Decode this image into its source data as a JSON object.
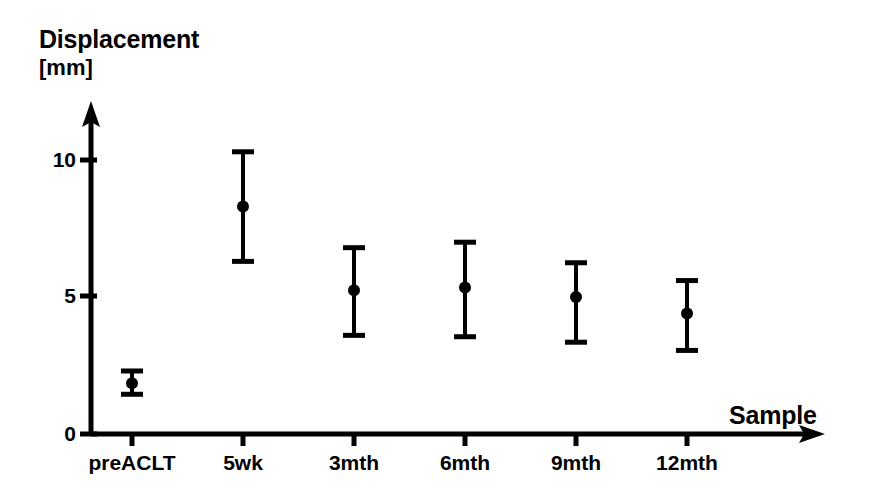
{
  "chart_data": {
    "type": "scatter",
    "title": "",
    "ylabel": "Displacement",
    "yunit": "[mm]",
    "xlabel": "Sample",
    "categories": [
      "preACLT",
      "5wk",
      "3mth",
      "6mth",
      "9mth",
      "12mth"
    ],
    "ytick_labels": [
      "0",
      "5",
      "10"
    ],
    "ytick_values": [
      0,
      5,
      10
    ],
    "ylim": [
      0,
      11.8
    ],
    "grid": false,
    "legend": null,
    "error_bar_kind": "mean with upper/lower whiskers",
    "series": [
      {
        "name": "Displacement",
        "marker": "filled-circle",
        "color": "#000000",
        "values": [
          1.85,
          8.3,
          5.25,
          5.35,
          5.0,
          4.4
        ],
        "upper": [
          2.3,
          10.3,
          6.8,
          7.0,
          6.25,
          5.6
        ],
        "lower": [
          1.45,
          6.3,
          3.6,
          3.55,
          3.35,
          3.05
        ]
      }
    ],
    "points": [
      {
        "category": "preACLT",
        "mean": 1.85,
        "upper": 2.3,
        "lower": 1.45
      },
      {
        "category": "5wk",
        "mean": 8.3,
        "upper": 10.3,
        "lower": 6.3
      },
      {
        "category": "3mth",
        "mean": 5.25,
        "upper": 6.8,
        "lower": 3.6
      },
      {
        "category": "6mth",
        "mean": 5.35,
        "upper": 7.0,
        "lower": 3.55
      },
      {
        "category": "9mth",
        "mean": 5.0,
        "upper": 6.25,
        "lower": 3.35
      },
      {
        "category": "12mth",
        "mean": 4.4,
        "upper": 5.6,
        "lower": 3.05
      }
    ]
  },
  "axes": {
    "y_title": "Displacement",
    "y_unit": "[mm]",
    "x_title": "Sample"
  },
  "ticks": {
    "y": [
      {
        "label": "10"
      },
      {
        "label": "5"
      },
      {
        "label": "0"
      }
    ],
    "x": [
      {
        "label": "preACLT"
      },
      {
        "label": "5wk"
      },
      {
        "label": "3mth"
      },
      {
        "label": "6mth"
      },
      {
        "label": "9mth"
      },
      {
        "label": "12mth"
      }
    ]
  },
  "style": {
    "ink": "#000000",
    "paper": "#ffffff"
  }
}
